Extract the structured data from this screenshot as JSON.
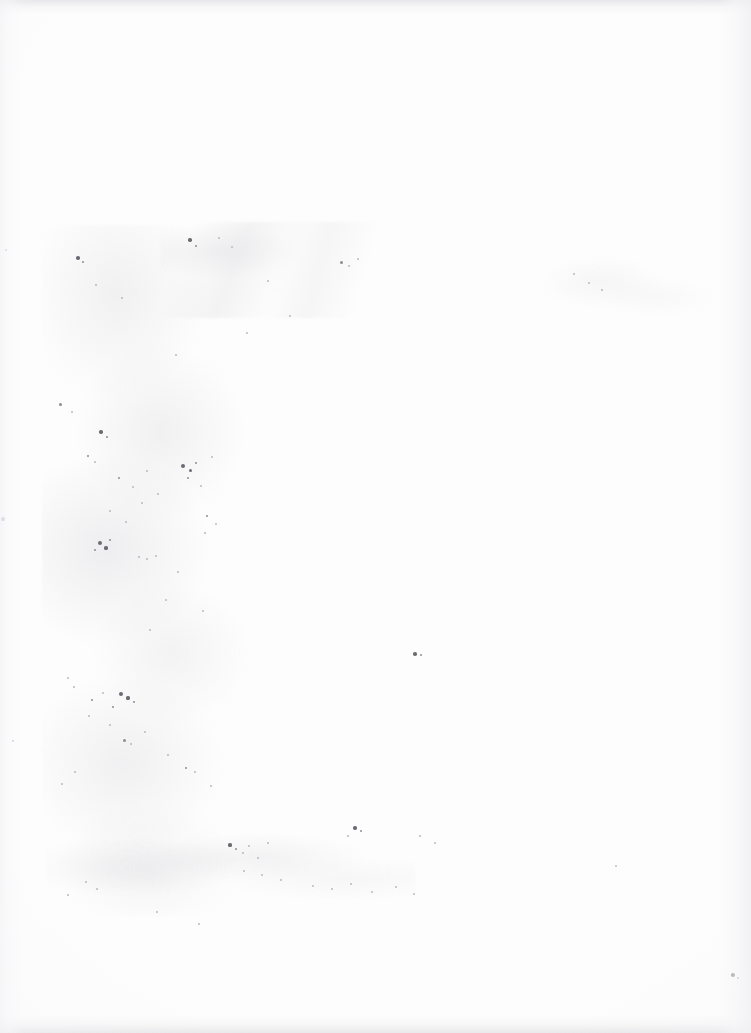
{
  "page": {
    "kind": "scanned-page",
    "content_text": "",
    "width_px": 751,
    "height_px": 1033,
    "background_color": "#fdfdfd",
    "paper_tone": "#fefefe"
  },
  "artifacts": {
    "edge_shading": [
      {
        "name": "top-edge-band",
        "color": "#e2e2e7"
      },
      {
        "name": "bottom-edge-band",
        "color": "#e4e4e7"
      },
      {
        "name": "right-curl-shadow",
        "color": "#f0f0f3"
      },
      {
        "name": "left-margin-shade",
        "color": "#f3f3f6"
      }
    ],
    "smudges": [
      {
        "name": "left-foxing-column",
        "color": "#b2b2ba"
      },
      {
        "name": "upper-diagonal-streaks",
        "color": "#b6b6be"
      },
      {
        "name": "right-haze",
        "color": "#bebec6"
      },
      {
        "name": "lower-wash",
        "color": "#b6b6be"
      }
    ],
    "speck_color": "#8c8c94",
    "speck_color_dark": "#6b6b74",
    "speck_color_faint": "#b9b9c1",
    "specks": [
      {
        "x": 6,
        "y": 250,
        "r": 1.4,
        "tone": "faint"
      },
      {
        "x": 3,
        "y": 519,
        "r": 1.6,
        "tone": "faint"
      },
      {
        "x": 13,
        "y": 741,
        "r": 1.2,
        "tone": "faint"
      },
      {
        "x": 78,
        "y": 258,
        "r": 1.8,
        "tone": "dark"
      },
      {
        "x": 83,
        "y": 262,
        "r": 1.1,
        "tone": "normal"
      },
      {
        "x": 96,
        "y": 285,
        "r": 1.3,
        "tone": "faint"
      },
      {
        "x": 122,
        "y": 298,
        "r": 1.0,
        "tone": "faint"
      },
      {
        "x": 190,
        "y": 240,
        "r": 1.7,
        "tone": "dark"
      },
      {
        "x": 196,
        "y": 246,
        "r": 1.0,
        "tone": "normal"
      },
      {
        "x": 219,
        "y": 238,
        "r": 1.2,
        "tone": "faint"
      },
      {
        "x": 232,
        "y": 247,
        "r": 1.1,
        "tone": "faint"
      },
      {
        "x": 268,
        "y": 281,
        "r": 1.3,
        "tone": "faint"
      },
      {
        "x": 341,
        "y": 262,
        "r": 1.5,
        "tone": "normal"
      },
      {
        "x": 349,
        "y": 266,
        "r": 1.2,
        "tone": "faint"
      },
      {
        "x": 358,
        "y": 259,
        "r": 1.0,
        "tone": "faint"
      },
      {
        "x": 574,
        "y": 274,
        "r": 1.4,
        "tone": "faint"
      },
      {
        "x": 589,
        "y": 283,
        "r": 1.1,
        "tone": "faint"
      },
      {
        "x": 602,
        "y": 290,
        "r": 1.0,
        "tone": "faint"
      },
      {
        "x": 60,
        "y": 404,
        "r": 1.5,
        "tone": "normal"
      },
      {
        "x": 72,
        "y": 412,
        "r": 1.1,
        "tone": "faint"
      },
      {
        "x": 101,
        "y": 432,
        "r": 1.7,
        "tone": "dark"
      },
      {
        "x": 107,
        "y": 437,
        "r": 1.2,
        "tone": "normal"
      },
      {
        "x": 88,
        "y": 456,
        "r": 1.3,
        "tone": "normal"
      },
      {
        "x": 95,
        "y": 462,
        "r": 1.0,
        "tone": "faint"
      },
      {
        "x": 119,
        "y": 478,
        "r": 1.4,
        "tone": "normal"
      },
      {
        "x": 133,
        "y": 487,
        "r": 1.1,
        "tone": "faint"
      },
      {
        "x": 147,
        "y": 471,
        "r": 1.2,
        "tone": "faint"
      },
      {
        "x": 158,
        "y": 494,
        "r": 1.0,
        "tone": "faint"
      },
      {
        "x": 183,
        "y": 466,
        "r": 2.0,
        "tone": "dark"
      },
      {
        "x": 190,
        "y": 470,
        "r": 1.5,
        "tone": "dark"
      },
      {
        "x": 196,
        "y": 463,
        "r": 1.1,
        "tone": "normal"
      },
      {
        "x": 188,
        "y": 478,
        "r": 1.3,
        "tone": "normal"
      },
      {
        "x": 201,
        "y": 486,
        "r": 1.0,
        "tone": "faint"
      },
      {
        "x": 212,
        "y": 457,
        "r": 1.2,
        "tone": "faint"
      },
      {
        "x": 110,
        "y": 511,
        "r": 1.1,
        "tone": "faint"
      },
      {
        "x": 126,
        "y": 522,
        "r": 1.3,
        "tone": "faint"
      },
      {
        "x": 142,
        "y": 503,
        "r": 1.0,
        "tone": "faint"
      },
      {
        "x": 207,
        "y": 516,
        "r": 1.4,
        "tone": "normal"
      },
      {
        "x": 216,
        "y": 524,
        "r": 1.1,
        "tone": "faint"
      },
      {
        "x": 100,
        "y": 543,
        "r": 2.2,
        "tone": "dark"
      },
      {
        "x": 106,
        "y": 548,
        "r": 1.6,
        "tone": "dark"
      },
      {
        "x": 95,
        "y": 550,
        "r": 1.3,
        "tone": "normal"
      },
      {
        "x": 110,
        "y": 540,
        "r": 1.1,
        "tone": "normal"
      },
      {
        "x": 139,
        "y": 557,
        "r": 1.2,
        "tone": "faint"
      },
      {
        "x": 147,
        "y": 559,
        "r": 1.0,
        "tone": "faint"
      },
      {
        "x": 156,
        "y": 556,
        "r": 1.1,
        "tone": "faint"
      },
      {
        "x": 178,
        "y": 572,
        "r": 1.0,
        "tone": "faint"
      },
      {
        "x": 205,
        "y": 533,
        "r": 1.2,
        "tone": "faint"
      },
      {
        "x": 415,
        "y": 654,
        "r": 1.8,
        "tone": "dark"
      },
      {
        "x": 421,
        "y": 655,
        "r": 1.2,
        "tone": "normal"
      },
      {
        "x": 68,
        "y": 678,
        "r": 1.3,
        "tone": "faint"
      },
      {
        "x": 74,
        "y": 687,
        "r": 1.1,
        "tone": "faint"
      },
      {
        "x": 92,
        "y": 700,
        "r": 1.4,
        "tone": "normal"
      },
      {
        "x": 103,
        "y": 693,
        "r": 1.1,
        "tone": "faint"
      },
      {
        "x": 121,
        "y": 694,
        "r": 2.1,
        "tone": "dark"
      },
      {
        "x": 128,
        "y": 698,
        "r": 1.6,
        "tone": "dark"
      },
      {
        "x": 134,
        "y": 702,
        "r": 1.2,
        "tone": "normal"
      },
      {
        "x": 113,
        "y": 707,
        "r": 1.1,
        "tone": "normal"
      },
      {
        "x": 89,
        "y": 716,
        "r": 1.2,
        "tone": "faint"
      },
      {
        "x": 110,
        "y": 725,
        "r": 1.0,
        "tone": "faint"
      },
      {
        "x": 124,
        "y": 740,
        "r": 1.5,
        "tone": "normal"
      },
      {
        "x": 131,
        "y": 744,
        "r": 1.1,
        "tone": "faint"
      },
      {
        "x": 145,
        "y": 732,
        "r": 1.0,
        "tone": "faint"
      },
      {
        "x": 168,
        "y": 755,
        "r": 1.2,
        "tone": "faint"
      },
      {
        "x": 186,
        "y": 768,
        "r": 1.4,
        "tone": "normal"
      },
      {
        "x": 195,
        "y": 772,
        "r": 1.0,
        "tone": "faint"
      },
      {
        "x": 75,
        "y": 772,
        "r": 1.1,
        "tone": "faint"
      },
      {
        "x": 62,
        "y": 784,
        "r": 1.0,
        "tone": "faint"
      },
      {
        "x": 211,
        "y": 786,
        "r": 1.1,
        "tone": "faint"
      },
      {
        "x": 230,
        "y": 845,
        "r": 1.6,
        "tone": "dark"
      },
      {
        "x": 236,
        "y": 849,
        "r": 1.2,
        "tone": "normal"
      },
      {
        "x": 243,
        "y": 853,
        "r": 1.0,
        "tone": "faint"
      },
      {
        "x": 249,
        "y": 846,
        "r": 1.1,
        "tone": "faint"
      },
      {
        "x": 258,
        "y": 858,
        "r": 1.0,
        "tone": "faint"
      },
      {
        "x": 268,
        "y": 843,
        "r": 1.2,
        "tone": "faint"
      },
      {
        "x": 244,
        "y": 871,
        "r": 1.0,
        "tone": "faint"
      },
      {
        "x": 262,
        "y": 875,
        "r": 1.1,
        "tone": "faint"
      },
      {
        "x": 281,
        "y": 880,
        "r": 1.0,
        "tone": "faint"
      },
      {
        "x": 355,
        "y": 828,
        "r": 1.8,
        "tone": "dark"
      },
      {
        "x": 361,
        "y": 831,
        "r": 1.2,
        "tone": "normal"
      },
      {
        "x": 348,
        "y": 836,
        "r": 1.1,
        "tone": "faint"
      },
      {
        "x": 313,
        "y": 886,
        "r": 1.0,
        "tone": "faint"
      },
      {
        "x": 332,
        "y": 889,
        "r": 1.1,
        "tone": "faint"
      },
      {
        "x": 351,
        "y": 884,
        "r": 1.0,
        "tone": "faint"
      },
      {
        "x": 372,
        "y": 892,
        "r": 1.2,
        "tone": "faint"
      },
      {
        "x": 396,
        "y": 887,
        "r": 1.0,
        "tone": "faint"
      },
      {
        "x": 414,
        "y": 894,
        "r": 1.1,
        "tone": "faint"
      },
      {
        "x": 86,
        "y": 882,
        "r": 1.3,
        "tone": "faint"
      },
      {
        "x": 97,
        "y": 889,
        "r": 1.0,
        "tone": "faint"
      },
      {
        "x": 68,
        "y": 895,
        "r": 1.1,
        "tone": "faint"
      },
      {
        "x": 157,
        "y": 912,
        "r": 1.0,
        "tone": "faint"
      },
      {
        "x": 199,
        "y": 924,
        "r": 1.0,
        "tone": "faint"
      },
      {
        "x": 420,
        "y": 836,
        "r": 1.0,
        "tone": "faint"
      },
      {
        "x": 435,
        "y": 843,
        "r": 1.1,
        "tone": "faint"
      },
      {
        "x": 733,
        "y": 975,
        "r": 1.9,
        "tone": "dark"
      },
      {
        "x": 738,
        "y": 978,
        "r": 1.1,
        "tone": "normal"
      },
      {
        "x": 616,
        "y": 866,
        "r": 1.0,
        "tone": "faint"
      },
      {
        "x": 290,
        "y": 316,
        "r": 1.0,
        "tone": "faint"
      },
      {
        "x": 247,
        "y": 333,
        "r": 1.1,
        "tone": "faint"
      },
      {
        "x": 176,
        "y": 355,
        "r": 1.0,
        "tone": "faint"
      },
      {
        "x": 166,
        "y": 600,
        "r": 1.1,
        "tone": "faint"
      },
      {
        "x": 150,
        "y": 630,
        "r": 1.0,
        "tone": "faint"
      },
      {
        "x": 203,
        "y": 611,
        "r": 1.0,
        "tone": "faint"
      }
    ]
  }
}
